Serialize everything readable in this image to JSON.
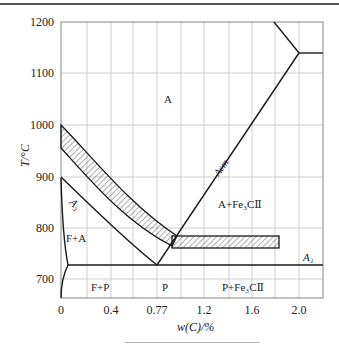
{
  "figure": {
    "type": "Fe-Fe3C phase diagram (steel portion) with critical temperature bands",
    "y_axis": {
      "label": "T/°C",
      "ticks": [
        "1200",
        "1100",
        "1000",
        "900",
        "800",
        "700"
      ]
    },
    "x_axis": {
      "label": "w(C)/%",
      "ticks": [
        "0",
        "0.4",
        "0.77",
        "1.2",
        "1.6",
        "2.0"
      ]
    },
    "regions": {
      "austenite": "A",
      "ferrite_austenite": "F+A",
      "ferrite_pearlite": "F+P",
      "pearlite": "P",
      "austenite_cementite": "A+Fe₃CⅡ",
      "pearlite_cementite": "P+Fe₃CⅡ"
    },
    "line_labels": {
      "a3": "A₃",
      "acm": "Acm",
      "a1": "A₁"
    },
    "colors": {
      "line": "#1a1a1a",
      "grid": "#c8c8c8",
      "border": "#888888"
    }
  }
}
